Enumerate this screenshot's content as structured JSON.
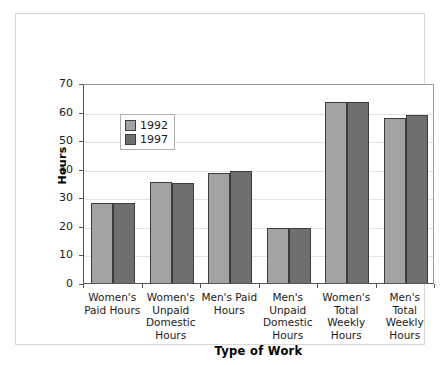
{
  "chart_data": {
    "type": "bar",
    "title": "",
    "xlabel": "Type of Work",
    "ylabel": "Hours",
    "ylim": [
      0,
      70
    ],
    "ytick_step": 10,
    "yticks": [
      "70",
      "60",
      "50",
      "40",
      "30",
      "20",
      "10",
      "0"
    ],
    "grid": true,
    "legend_position": "inside-upper-left",
    "categories": [
      "Women's\nPaid Hours",
      "Women's\nUnpaid\nDomestic\nHours",
      "Men's Paid\nHours",
      "Men's\nUnpaid\nDomestic\nHours",
      "Women's\nTotal\nWeekly\nHours",
      "Men's Total\nWeekly\nHours"
    ],
    "category_labels": [
      [
        "Women's",
        "Paid Hours"
      ],
      [
        "Women's",
        "Unpaid",
        "Domestic",
        "Hours"
      ],
      [
        "Men's Paid",
        "Hours"
      ],
      [
        "Men's",
        "Unpaid",
        "Domestic",
        "Hours"
      ],
      [
        "Women's",
        "Total",
        "Weekly",
        "Hours"
      ],
      [
        "Men's Total",
        "Weekly",
        "Hours"
      ]
    ],
    "series": [
      {
        "name": "1992",
        "color": "#a3a3a3",
        "values": [
          27.9,
          35.4,
          38.5,
          19.2,
          63.4,
          57.8
        ]
      },
      {
        "name": "1997",
        "color": "#6f6f6f",
        "values": [
          28.0,
          35.1,
          39.2,
          19.4,
          63.4,
          58.8
        ]
      }
    ]
  },
  "legend": {
    "entries": [
      {
        "label": "1992",
        "color": "#a3a3a3"
      },
      {
        "label": "1997",
        "color": "#6f6f6f"
      }
    ]
  },
  "axes": {
    "y_title": "Hours",
    "x_title": "Type of Work"
  }
}
